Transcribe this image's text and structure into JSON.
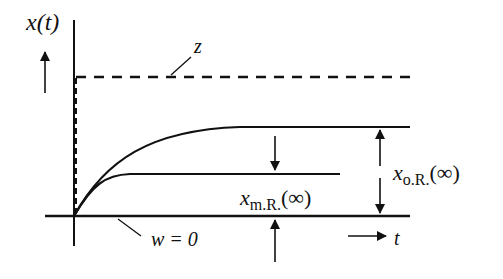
{
  "diagram": {
    "y_axis_label": "x(t)",
    "x_axis_label": "t",
    "setpoint_label": "z",
    "disturbance_label": "w = 0",
    "offset_m_label": {
      "main": "x",
      "sub": "m.R.",
      "arg": "(∞)"
    },
    "offset_o_label": {
      "main": "x",
      "sub": "o.R.",
      "arg": "(∞)"
    },
    "colors": {
      "ink": "#111111",
      "background": "#ffffff"
    }
  }
}
